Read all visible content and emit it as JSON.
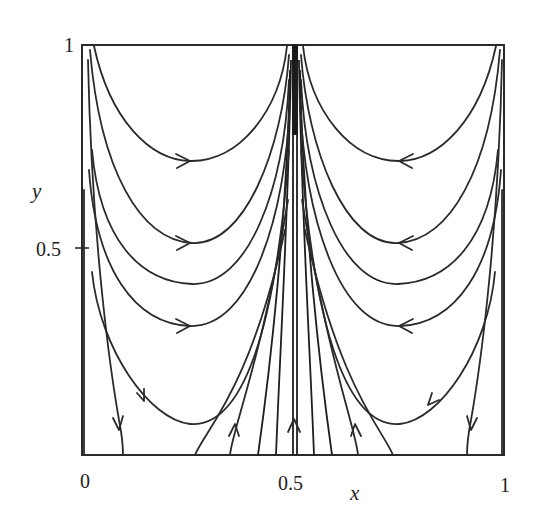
{
  "figure": {
    "type": "phase-portrait",
    "x_axis": {
      "label": "x",
      "ticks": [
        {
          "value": 0,
          "label": "0"
        },
        {
          "value": 0.5,
          "label": "0.5"
        },
        {
          "value": 1,
          "label": "1"
        }
      ]
    },
    "y_axis": {
      "label": "y",
      "ticks": [
        {
          "value": 0.5,
          "label": "0.5"
        },
        {
          "value": 1,
          "label": "1"
        }
      ]
    },
    "domain": {
      "x": [
        0,
        1
      ],
      "y": [
        0,
        1
      ]
    },
    "colors": {
      "line": "#2a2a2a",
      "background": "#ffffff"
    },
    "left_half_flow": "clockwise-ish: down along left edge, right along U-curves, up into x = 0.5",
    "right_half_flow": "mirror: down along right edge, left along U-curves, up into x = 0.5",
    "arrow_directions": {
      "upper_left_u_curves": "right",
      "upper_right_u_curves": "left",
      "near_walls": "down",
      "center_bottom": "up"
    }
  }
}
